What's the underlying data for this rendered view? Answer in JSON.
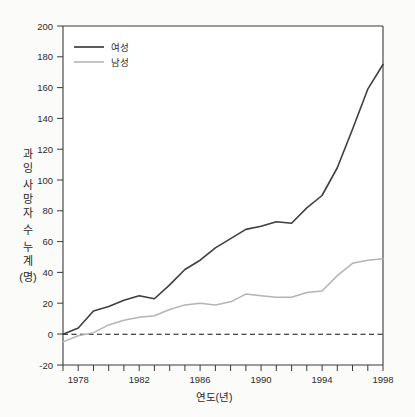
{
  "chart_data": {
    "type": "line",
    "title": "",
    "xlabel": "연도(년)",
    "ylabel": "과잉 사망자 수 누계 (명)",
    "ylabel_chars": [
      "과",
      "잉",
      "사",
      "망",
      "자",
      "수",
      "누",
      "계",
      "(명)"
    ],
    "xlim": [
      1977,
      1998
    ],
    "ylim": [
      -20,
      200
    ],
    "ytick_values": [
      -20,
      0,
      20,
      40,
      60,
      80,
      100,
      120,
      140,
      160,
      180,
      200
    ],
    "ytick_labels": [
      "-20",
      "0",
      "20",
      "40",
      "60",
      "80",
      "100",
      "120",
      "140",
      "160",
      "180",
      "200"
    ],
    "xtick_major_values": [
      1978,
      1982,
      1986,
      1990,
      1994,
      1998
    ],
    "xtick_major_labels": [
      "1978",
      "1982",
      "1986",
      "1990",
      "1994",
      "1998"
    ],
    "xtick_minor_values": [
      1979,
      1980,
      1981,
      1983,
      1984,
      1985,
      1987,
      1988,
      1989,
      1991,
      1992,
      1993,
      1995,
      1996,
      1997
    ],
    "grid": false,
    "legend_position": "top-left",
    "zero_reference_line": 0,
    "x": [
      1977,
      1978,
      1979,
      1980,
      1981,
      1982,
      1983,
      1984,
      1985,
      1986,
      1987,
      1988,
      1989,
      1990,
      1991,
      1992,
      1993,
      1994,
      1995,
      1996,
      1997,
      1998
    ],
    "series": [
      {
        "name": "여성",
        "color": "#3f3f3f",
        "values": [
          0,
          4,
          15,
          18,
          22,
          25,
          23,
          32,
          42,
          48,
          56,
          62,
          68,
          70,
          73,
          72,
          82,
          90,
          108,
          133,
          159,
          175
        ]
      },
      {
        "name": "남성",
        "color": "#b4b4b4",
        "values": [
          -5,
          -1,
          1,
          6,
          9,
          11,
          12,
          16,
          19,
          20,
          19,
          21,
          26,
          25,
          24,
          24,
          27,
          28,
          38,
          46,
          48,
          49
        ]
      }
    ]
  },
  "legend": {
    "entries": [
      {
        "label": "여성",
        "swatch_color": "#3f3f3f"
      },
      {
        "label": "남성",
        "swatch_color": "#b4b4b4"
      }
    ]
  },
  "axes": {
    "x_title": "연도(년)",
    "y_title": "과잉 사망자 수 누계 (명)"
  }
}
